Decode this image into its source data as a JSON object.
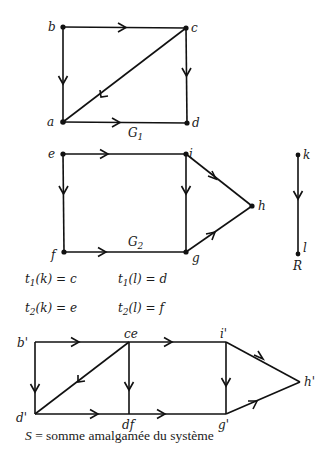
{
  "colors": {
    "ink": "#111111",
    "background": "#ffffff"
  },
  "graphs": {
    "G1": {
      "label": "G",
      "label_sub": "1",
      "nodes": [
        {
          "id": "b",
          "label": "b",
          "x": 63,
          "y": 27
        },
        {
          "id": "c",
          "label": "c",
          "x": 186,
          "y": 28
        },
        {
          "id": "a",
          "label": "a",
          "x": 63,
          "y": 122
        },
        {
          "id": "d",
          "label": "d",
          "x": 187,
          "y": 123
        }
      ],
      "edges": [
        [
          "b",
          "c"
        ],
        [
          "b",
          "a"
        ],
        [
          "c",
          "d"
        ],
        [
          "c",
          "a"
        ],
        [
          "a",
          "d"
        ]
      ]
    },
    "G2": {
      "label": "G",
      "label_sub": "2",
      "nodes": [
        {
          "id": "e",
          "label": "e",
          "x": 63,
          "y": 154
        },
        {
          "id": "i",
          "label": "i",
          "x": 186,
          "y": 154
        },
        {
          "id": "h",
          "label": "h",
          "x": 252,
          "y": 206
        },
        {
          "id": "f",
          "label": "f",
          "x": 64,
          "y": 252
        },
        {
          "id": "g",
          "label": "g",
          "x": 186,
          "y": 252
        }
      ],
      "edges": [
        [
          "e",
          "i"
        ],
        [
          "e",
          "f"
        ],
        [
          "i",
          "g"
        ],
        [
          "i",
          "h"
        ],
        [
          "f",
          "g"
        ],
        [
          "g",
          "h"
        ]
      ]
    },
    "R": {
      "label": "R",
      "nodes": [
        {
          "id": "k",
          "label": "k",
          "x": 298,
          "y": 155
        },
        {
          "id": "l",
          "label": "l",
          "x": 298,
          "y": 254
        }
      ],
      "edges": [
        [
          "k",
          "l"
        ]
      ]
    },
    "S": {
      "nodes": [
        {
          "id": "b'",
          "label": "b'",
          "x": 35,
          "y": 342
        },
        {
          "id": "ce",
          "label": "ce",
          "x": 129,
          "y": 342
        },
        {
          "id": "i'",
          "label": "i'",
          "x": 226,
          "y": 342
        },
        {
          "id": "h'",
          "label": "h'",
          "x": 300,
          "y": 382
        },
        {
          "id": "d'",
          "label": "d'",
          "x": 35,
          "y": 414
        },
        {
          "id": "df",
          "label": "df",
          "x": 129,
          "y": 414
        },
        {
          "id": "g'",
          "label": "g'",
          "x": 226,
          "y": 414
        }
      ],
      "edges": [
        [
          "b'",
          "ce"
        ],
        [
          "ce",
          "i'"
        ],
        [
          "b'",
          "d'"
        ],
        [
          "ce",
          "d'"
        ],
        [
          "ce",
          "df"
        ],
        [
          "d'",
          "df"
        ],
        [
          "df",
          "g'"
        ],
        [
          "i'",
          "g'"
        ],
        [
          "i'",
          "h'"
        ],
        [
          "g'",
          "h'"
        ]
      ]
    }
  },
  "equations": {
    "t1k": {
      "fn": "t",
      "sub": "1",
      "arg": "(k) = c"
    },
    "t1l": {
      "fn": "t",
      "sub": "1",
      "arg": "(l) = d"
    },
    "t2k": {
      "fn": "t",
      "sub": "2",
      "arg": "(k) = e"
    },
    "t2l": {
      "fn": "t",
      "sub": "2",
      "arg": "(l) = f"
    }
  },
  "caption": {
    "symbol": "S",
    "text": " = somme amalgamée du système"
  }
}
